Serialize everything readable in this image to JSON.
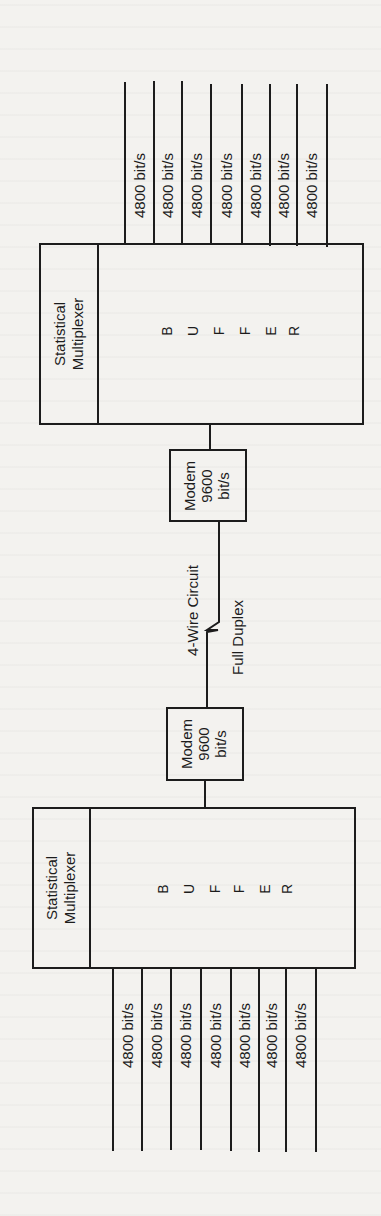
{
  "diagram": {
    "colors": {
      "ink": "#1c1c1c",
      "paper": "#f3f2ef"
    },
    "top_multiplexer": {
      "label_line1": "Statistical",
      "label_line2": "Multiplexer",
      "buffer_letters": [
        "B",
        "U",
        "F",
        "F",
        "E",
        "R"
      ],
      "channels": [
        {
          "rate": "4800 bit/s"
        },
        {
          "rate": "4800 bit/s"
        },
        {
          "rate": "4800 bit/s"
        },
        {
          "rate": "4800 bit/s"
        },
        {
          "rate": "4800 bit/s"
        },
        {
          "rate": "4800 bit/s"
        },
        {
          "rate": "4800 bit/s"
        }
      ]
    },
    "top_modem": {
      "line1": "Modem",
      "line2": "9600",
      "line3": "bit/s"
    },
    "circuit": {
      "label_left": "4-Wire Circuit",
      "label_right": "Full Duplex"
    },
    "bottom_modem": {
      "line1": "Modem",
      "line2": "9600",
      "line3": "bit/s"
    },
    "bottom_multiplexer": {
      "label_line1": "Statistical",
      "label_line2": "Multiplexer",
      "buffer_letters": [
        "B",
        "U",
        "F",
        "F",
        "E",
        "R"
      ],
      "channels": [
        {
          "rate": "4800 bit/s"
        },
        {
          "rate": "4800 bit/s"
        },
        {
          "rate": "4800 bit/s"
        },
        {
          "rate": "4800 bit/s"
        },
        {
          "rate": "4800 bit/s"
        },
        {
          "rate": "4800 bit/s"
        },
        {
          "rate": "4800 bit/s"
        }
      ]
    }
  }
}
